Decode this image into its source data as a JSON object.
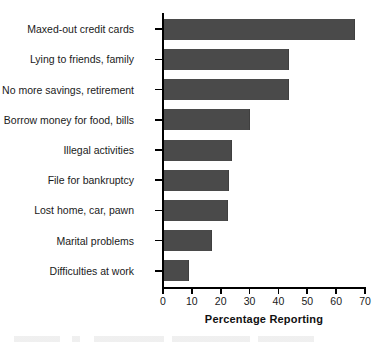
{
  "chart_data": {
    "type": "bar",
    "orientation": "horizontal",
    "title": "",
    "xlabel": "Percentage Reporting",
    "ylabel": "",
    "xlim": [
      0,
      70
    ],
    "xticks": [
      0,
      10,
      20,
      30,
      40,
      50,
      60,
      70
    ],
    "xtick_labels": [
      "0",
      "10",
      "20",
      "30",
      "40",
      "50",
      "60",
      "70"
    ],
    "grid": false,
    "legend": null,
    "bar_color": "#4a4a4a",
    "categories": [
      "Maxed-out credit cards",
      "Lying to friends, family",
      "No more savings, retirement",
      "Borrow money for food, bills",
      "Illegal activities",
      "File for bankruptcy",
      "Lost home, car, pawn",
      "Marital problems",
      "Difficulties at work"
    ],
    "values": [
      66.5,
      43.5,
      43.5,
      30,
      24,
      23,
      22.5,
      17,
      9
    ]
  }
}
